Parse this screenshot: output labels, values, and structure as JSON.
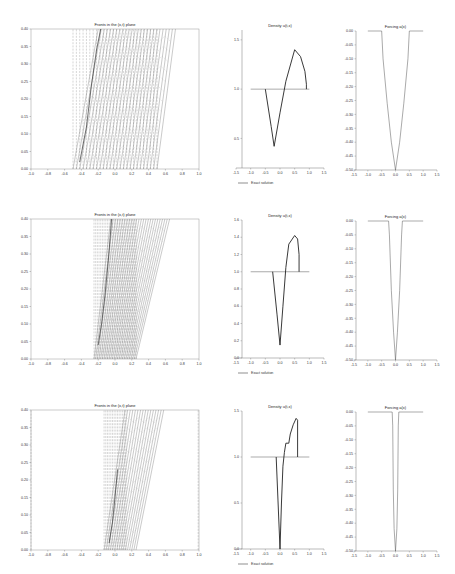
{
  "figure": {
    "rows": 3,
    "panels_per_row": [
      "fronts",
      "density",
      "forcing"
    ]
  },
  "chart_data": [
    {
      "row": 0,
      "panel": "fronts",
      "type": "line",
      "title": "Fronts in the (x,t) plane",
      "xlabel": "",
      "ylabel": "",
      "xlim": [
        -1.0,
        1.0
      ],
      "ylim": [
        0.0,
        0.4
      ],
      "xticks": [
        "-1.0",
        "-0.8",
        "-0.6",
        "-0.4",
        "-0.2",
        "0.0",
        "0.2",
        "0.4",
        "0.6",
        "0.8",
        "1.0"
      ],
      "yticks": [
        "0.00",
        "0.05",
        "0.10",
        "0.15",
        "0.20",
        "0.25",
        "0.30",
        "0.35",
        "0.40"
      ],
      "dashed_vertical_x": [
        -0.5,
        -0.46,
        -0.42,
        -0.38,
        -0.34,
        -0.3,
        -0.26,
        -0.22,
        -0.18,
        -0.14,
        -0.1,
        -0.06,
        -0.02,
        0.02,
        0.06,
        0.1,
        0.14,
        0.18,
        0.22,
        0.26,
        0.3,
        0.34,
        0.38,
        0.42,
        0.46,
        0.5
      ],
      "solid_fronts": {
        "x0_range": [
          -0.5,
          0.5
        ],
        "x1_range": [
          -0.2,
          0.72
        ],
        "count": 26
      },
      "shock_curve": [
        [
          -0.42,
          0.02
        ],
        [
          -0.34,
          0.12
        ],
        [
          -0.28,
          0.24
        ],
        [
          -0.22,
          0.34
        ],
        [
          -0.17,
          0.4
        ]
      ]
    },
    {
      "row": 0,
      "panel": "density",
      "type": "line",
      "title": "Density u(t,x)",
      "xlim": [
        -1.5,
        1.5
      ],
      "ylim": [
        0.2,
        1.6
      ],
      "xticks": [
        "-1.5",
        "-1.0",
        "-0.5",
        "0.0",
        "0.5",
        "1.0",
        "1.5"
      ],
      "yticks": [
        "0.5",
        "1.0",
        "1.5"
      ],
      "legend": [
        "Exact solution"
      ],
      "series": [
        {
          "name": "initial",
          "x": [
            -1.0,
            1.0
          ],
          "y": [
            1.0,
            1.0
          ]
        },
        {
          "name": "Exact solution",
          "x": [
            -0.5,
            -0.3,
            -0.2,
            0.0,
            0.2,
            0.5,
            0.7,
            0.85,
            0.9,
            0.9
          ],
          "y": [
            1.0,
            0.62,
            0.42,
            0.76,
            1.08,
            1.4,
            1.33,
            1.18,
            1.05,
            1.0
          ]
        }
      ]
    },
    {
      "row": 0,
      "panel": "forcing",
      "type": "line",
      "title": "Forcing a(x)",
      "xlim": [
        -1.5,
        1.5
      ],
      "ylim": [
        -0.5,
        0.0
      ],
      "xticks": [
        "-1.5",
        "-1.0",
        "-0.5",
        "0.0",
        "0.5",
        "1.0",
        "1.5"
      ],
      "yticks": [
        "0.00",
        "-0.05",
        "-0.10",
        "-0.15",
        "-0.20",
        "-0.25",
        "-0.30",
        "-0.35",
        "-0.40",
        "-0.45",
        "-0.50"
      ],
      "series": [
        {
          "name": "a(x)",
          "x": [
            -1.0,
            -0.5,
            -0.45,
            -0.3,
            -0.15,
            0.0,
            0.15,
            0.3,
            0.45,
            0.5,
            1.0
          ],
          "y": [
            0.0,
            0.0,
            -0.1,
            -0.26,
            -0.4,
            -0.5,
            -0.4,
            -0.26,
            -0.1,
            0.0,
            0.0
          ]
        }
      ]
    },
    {
      "row": 1,
      "panel": "fronts",
      "type": "line",
      "title": "Fronts in the (x,t) plane",
      "xlim": [
        -1.0,
        1.0
      ],
      "ylim": [
        0.0,
        0.4
      ],
      "xticks": [
        "-1.0",
        "-0.8",
        "-0.6",
        "-0.4",
        "-0.2",
        "0.0",
        "0.2",
        "0.4",
        "0.6",
        "0.8",
        "1.0"
      ],
      "yticks": [
        "0.00",
        "0.05",
        "0.10",
        "0.15",
        "0.20",
        "0.25",
        "0.30",
        "0.35",
        "0.40"
      ],
      "dashed_vertical_x": [
        -0.25,
        -0.23,
        -0.21,
        -0.19,
        -0.17,
        -0.15,
        -0.13,
        -0.11,
        -0.09,
        -0.07,
        -0.05,
        -0.03,
        -0.01,
        0.01,
        0.03,
        0.05,
        0.07,
        0.09,
        0.11,
        0.13,
        0.15,
        0.17,
        0.19,
        0.21,
        0.23,
        0.25
      ],
      "solid_fronts": {
        "x0_range": [
          -0.25,
          0.25
        ],
        "x1_range": [
          -0.05,
          0.65
        ],
        "count": 26
      },
      "shock_curve": [
        [
          -0.2,
          0.04
        ],
        [
          -0.16,
          0.1
        ],
        [
          -0.12,
          0.18
        ],
        [
          -0.08,
          0.28
        ],
        [
          -0.04,
          0.4
        ]
      ]
    },
    {
      "row": 1,
      "panel": "density",
      "type": "line",
      "title": "Density u(t,x)",
      "xlim": [
        -1.5,
        1.5
      ],
      "ylim": [
        0.0,
        1.6
      ],
      "xticks": [
        "-1.5",
        "-1.0",
        "-0.5",
        "0.0",
        "0.5",
        "1.0",
        "1.5"
      ],
      "yticks": [
        "0.0",
        "0.2",
        "0.4",
        "0.6",
        "0.8",
        "1.0",
        "1.2",
        "1.4",
        "1.6"
      ],
      "legend": [
        "Exact solution"
      ],
      "series": [
        {
          "name": "initial",
          "x": [
            -1.0,
            1.0
          ],
          "y": [
            1.0,
            1.0
          ]
        },
        {
          "name": "Exact solution",
          "x": [
            -0.25,
            -0.1,
            0.0,
            0.1,
            0.2,
            0.3,
            0.5,
            0.6,
            0.65,
            0.65
          ],
          "y": [
            1.0,
            0.5,
            0.15,
            0.6,
            1.05,
            1.32,
            1.42,
            1.38,
            1.2,
            1.0
          ]
        }
      ]
    },
    {
      "row": 1,
      "panel": "forcing",
      "type": "line",
      "title": "Forcing a(x)",
      "xlim": [
        -1.5,
        1.5
      ],
      "ylim": [
        -0.5,
        0.0
      ],
      "xticks": [
        "-1.5",
        "-1.0",
        "-0.5",
        "0.0",
        "0.5",
        "1.0",
        "1.5"
      ],
      "yticks": [
        "0.00",
        "-0.05",
        "-0.10",
        "-0.15",
        "-0.20",
        "-0.25",
        "-0.30",
        "-0.35",
        "-0.40",
        "-0.45",
        "-0.50"
      ],
      "series": [
        {
          "name": "a(x)",
          "x": [
            -1.0,
            -0.25,
            -0.22,
            -0.15,
            -0.07,
            0.0,
            0.07,
            0.15,
            0.22,
            0.25,
            1.0
          ],
          "y": [
            0.0,
            0.0,
            -0.05,
            -0.25,
            -0.4,
            -0.5,
            -0.4,
            -0.25,
            -0.05,
            0.0,
            0.0
          ]
        }
      ]
    },
    {
      "row": 2,
      "panel": "fronts",
      "type": "line",
      "title": "Fronts in the (x,t) plane",
      "xlim": [
        -1.0,
        1.0
      ],
      "ylim": [
        0.0,
        0.4
      ],
      "xticks": [
        "-1.0",
        "-0.8",
        "-0.6",
        "-0.4",
        "-0.2",
        "0.0",
        "0.2",
        "0.4",
        "0.6",
        "0.8",
        "1.0"
      ],
      "yticks": [
        "0.00",
        "0.05",
        "0.10",
        "0.15",
        "0.20",
        "0.25",
        "0.30",
        "0.35",
        "0.40"
      ],
      "dashed_vertical_x": [
        -1.0,
        -0.13,
        -0.11,
        -0.09,
        -0.07,
        -0.05,
        -0.03,
        -0.01,
        0.01,
        0.03,
        0.05,
        0.07,
        0.09,
        0.11,
        0.13,
        0.99
      ],
      "solid_fronts": {
        "x0_range": [
          -0.13,
          0.25
        ],
        "x1_range": [
          0.12,
          0.58
        ],
        "count": 16
      },
      "shock_curve": [
        [
          -0.07,
          0.02
        ],
        [
          -0.03,
          0.08
        ],
        [
          0.0,
          0.15
        ],
        [
          0.03,
          0.23
        ]
      ]
    },
    {
      "row": 2,
      "panel": "density",
      "type": "line",
      "title": "Density u(t,x)",
      "xlim": [
        -1.5,
        1.5
      ],
      "ylim": [
        0.0,
        1.5
      ],
      "xticks": [
        "-1.5",
        "-1.0",
        "-0.5",
        "0.0",
        "0.5",
        "1.0",
        "1.5"
      ],
      "yticks": [
        "0.0",
        "0.5",
        "1.0",
        "1.5"
      ],
      "legend": [
        "Exact solution"
      ],
      "series": [
        {
          "name": "initial",
          "x": [
            -1.0,
            1.0
          ],
          "y": [
            1.0,
            1.0
          ]
        },
        {
          "name": "Exact solution",
          "x": [
            -0.13,
            0.0,
            0.05,
            0.1,
            0.15,
            0.2,
            0.3,
            0.35,
            0.45,
            0.55,
            0.6,
            0.6
          ],
          "y": [
            1.0,
            0.0,
            0.5,
            0.9,
            1.05,
            1.15,
            1.15,
            1.25,
            1.35,
            1.42,
            1.4,
            1.0
          ]
        }
      ]
    },
    {
      "row": 2,
      "panel": "forcing",
      "type": "line",
      "title": "Forcing a(x)",
      "xlim": [
        -1.5,
        1.5
      ],
      "ylim": [
        -0.5,
        0.0
      ],
      "xticks": [
        "-1.5",
        "-1.0",
        "-0.5",
        "0.0",
        "0.5",
        "1.0",
        "1.5"
      ],
      "yticks": [
        "0.00",
        "-0.05",
        "-0.10",
        "-0.15",
        "-0.20",
        "-0.25",
        "-0.30",
        "-0.35",
        "-0.40",
        "-0.45",
        "-0.50"
      ],
      "series": [
        {
          "name": "a(x)",
          "x": [
            -1.0,
            -0.12,
            -0.1,
            -0.08,
            -0.05,
            0.0,
            0.05,
            0.08,
            0.1,
            0.12,
            1.0
          ],
          "y": [
            0.0,
            0.0,
            -0.05,
            -0.28,
            -0.42,
            -0.5,
            -0.42,
            -0.28,
            -0.05,
            0.0,
            0.0
          ]
        }
      ]
    }
  ]
}
